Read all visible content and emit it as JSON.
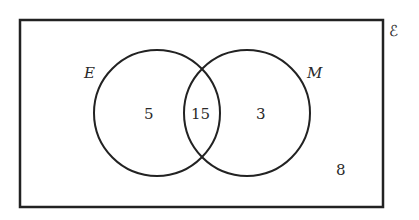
{
  "diagram": {
    "type": "venn",
    "universal_label": "ℰ",
    "sets": [
      {
        "name": "E",
        "only_count": "5"
      },
      {
        "name": "M",
        "only_count": "3"
      }
    ],
    "intersection_count": "15",
    "outside_count": "8"
  }
}
